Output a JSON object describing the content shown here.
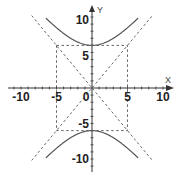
{
  "figure": {
    "title": "",
    "equation": "y^2/36 - x^2/25 = 1",
    "colors": {
      "axis": "#333333",
      "curve": "#555555",
      "dashed": "#666666",
      "text": "#222222"
    }
  },
  "axes": {
    "x": {
      "label": "X",
      "range": [
        -10,
        10
      ],
      "ticks": [
        -10,
        -5,
        0,
        5,
        10
      ],
      "tick_labels": [
        "-10",
        "-5",
        "0",
        "5",
        "10"
      ]
    },
    "y": {
      "label": "Y",
      "range": [
        -10,
        10
      ],
      "ticks": [
        -10,
        -5,
        5,
        10
      ],
      "tick_labels": [
        "-10",
        "-5",
        "5",
        "10"
      ]
    }
  },
  "chart_data": {
    "type": "line",
    "title": "",
    "xlabel": "X",
    "ylabel": "Y",
    "xlim": [
      -12,
      12
    ],
    "ylim": [
      -11,
      11
    ],
    "grid": false,
    "series": [
      {
        "name": "hyperbola upper branch",
        "style": "solid",
        "equation": "y = 6*sqrt(1 + x^2/25)",
        "x": [
          -6.5,
          -5,
          -4,
          -3,
          -2,
          -1,
          0,
          1,
          2,
          3,
          4,
          5,
          6.5
        ],
        "y": [
          9.84,
          8.49,
          7.68,
          7.0,
          6.46,
          6.12,
          6.0,
          6.12,
          6.46,
          7.0,
          7.68,
          8.49,
          9.84
        ]
      },
      {
        "name": "hyperbola lower branch",
        "style": "solid",
        "equation": "y = -6*sqrt(1 + x^2/25)",
        "x": [
          -6.5,
          -5,
          -4,
          -3,
          -2,
          -1,
          0,
          1,
          2,
          3,
          4,
          5,
          6.5
        ],
        "y": [
          -9.84,
          -8.49,
          -7.68,
          -7.0,
          -6.46,
          -6.12,
          -6.0,
          -6.12,
          -6.46,
          -7.0,
          -7.68,
          -8.49,
          -9.84
        ]
      },
      {
        "name": "asymptote y = 6/5 x",
        "style": "dashed",
        "x": [
          -8.5,
          8.5
        ],
        "y": [
          -10.2,
          10.2
        ]
      },
      {
        "name": "asymptote y = -6/5 x",
        "style": "dashed",
        "x": [
          -8.5,
          8.5
        ],
        "y": [
          10.2,
          -10.2
        ]
      },
      {
        "name": "fundamental rectangle",
        "style": "dashed",
        "x": [
          -5,
          5,
          5,
          -5,
          -5
        ],
        "y": [
          6,
          6,
          -6,
          -6,
          6
        ]
      }
    ]
  }
}
